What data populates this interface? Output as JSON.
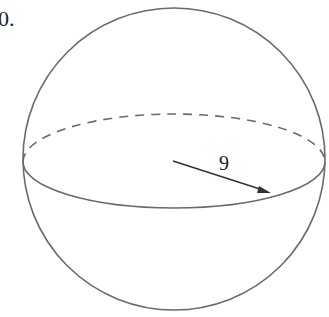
{
  "problem_number": "0.",
  "figure": {
    "type": "sphere",
    "radius_label": "9",
    "stroke_color": "#6a6a6a",
    "arrow_color": "#333333"
  }
}
